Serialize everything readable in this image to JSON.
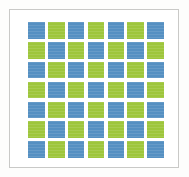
{
  "figure": {
    "frame": {
      "border_color": "#c9c9c7",
      "background_color": "#ffffff"
    },
    "page_background": "#fdfdfc"
  },
  "palette": {
    "blue": "#5590c2",
    "green": "#9ec63c"
  },
  "chart_data": {
    "type": "heatmap",
    "subtitle": "",
    "xlabel": "",
    "ylabel": "",
    "grid": true,
    "legend_position": "none",
    "rows": 7,
    "columns": 7,
    "categories": [
      "C1",
      "C2",
      "C3",
      "C4",
      "C5",
      "C6",
      "C7"
    ],
    "row_labels": [
      "R1",
      "R2",
      "R3",
      "R4",
      "R5",
      "R6",
      "R7"
    ],
    "value_map": {
      "0": "blue",
      "1": "green"
    },
    "color_map": {
      "blue": "#5590c2",
      "green": "#9ec63c"
    },
    "values": [
      [
        0,
        1,
        0,
        1,
        0,
        1,
        0
      ],
      [
        1,
        0,
        1,
        0,
        1,
        0,
        1
      ],
      [
        0,
        1,
        0,
        1,
        0,
        1,
        0
      ],
      [
        1,
        0,
        1,
        0,
        1,
        0,
        1
      ],
      [
        0,
        1,
        0,
        1,
        0,
        1,
        0
      ],
      [
        1,
        0,
        1,
        0,
        1,
        0,
        1
      ],
      [
        0,
        1,
        0,
        1,
        0,
        1,
        0
      ]
    ],
    "counts": {
      "blue": 25,
      "green": 24,
      "total": 49
    }
  }
}
